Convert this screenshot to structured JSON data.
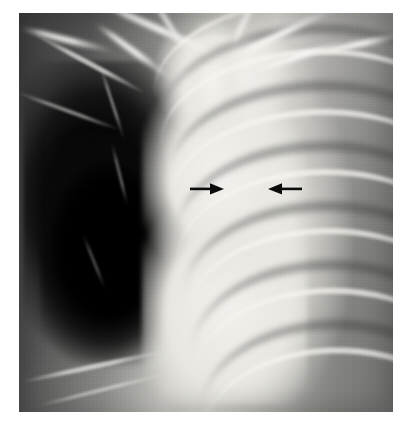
{
  "figure": {
    "kind": "chest-radiograph",
    "view": "frontal (PA) chest X-ray",
    "caption": "",
    "background_color": "#ffffff"
  },
  "plate": {
    "x": 19,
    "y": 13,
    "width": 374,
    "height": 399,
    "border_color": "#ffffff"
  },
  "annotations": [
    {
      "id": "arrow-left",
      "name": "annotation-arrow-right-pointing",
      "direction": "right",
      "color": "#0b0b0b",
      "x": 190,
      "y": 181,
      "width": 36,
      "height": 16,
      "points_at": "right margin of the central mediastinal density"
    },
    {
      "id": "arrow-right",
      "name": "annotation-arrow-left-pointing",
      "direction": "left",
      "color": "#0b0b0b",
      "x": 266,
      "y": 181,
      "width": 36,
      "height": 16,
      "points_at": "left margin of the central mediastinal density"
    }
  ],
  "regions": [
    {
      "name": "hyperlucent-hemithorax",
      "side": "viewer-left",
      "tone": "very dark / black",
      "tone_hex": "#060606"
    },
    {
      "name": "mediastinal-density",
      "side": "center",
      "tone": "bright white",
      "tone_hex": "#f0efeb"
    },
    {
      "name": "rib-cage-lung",
      "side": "viewer-right",
      "tone": "mid grey with rib bands",
      "tone_hex": "#9a9a97"
    },
    {
      "name": "apical-bony-struts",
      "side": "superior",
      "tone": "bright white",
      "tone_hex": "#f6f5f1"
    }
  ],
  "palette": {
    "film_black": "#060606",
    "film_dark_grey": "#3b3b3b",
    "film_mid_grey": "#8b8b88",
    "film_light_grey": "#c8c7c3",
    "film_white": "#f2f1ed",
    "arrow_black": "#0b0b0b",
    "page_white": "#ffffff"
  }
}
